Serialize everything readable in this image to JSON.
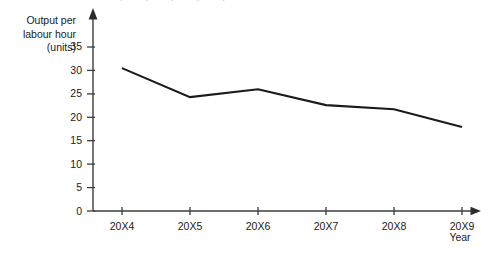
{
  "chart_data": {
    "type": "line",
    "title": "",
    "xlabel": "Year",
    "ylabel": "Output per labour hour (units)",
    "categories": [
      "20X4",
      "20X5",
      "20X6",
      "20X7",
      "20X8",
      "20X9"
    ],
    "values": [
      30.5,
      24.3,
      26.0,
      22.6,
      21.7,
      17.9
    ],
    "series": [
      {
        "name": "Output per labour hour",
        "values": [
          30.5,
          24.3,
          26.0,
          22.6,
          21.7,
          17.9
        ]
      }
    ],
    "ylim": [
      0,
      35
    ],
    "yticks": [
      0,
      5,
      10,
      15,
      20,
      25,
      30,
      35
    ],
    "ytick_labels": [
      "0",
      "5",
      "10",
      "15",
      "20",
      "25",
      "30",
      "35"
    ],
    "grid": false,
    "legend": "none",
    "line_color": "#1a1a1a",
    "axis_color": "#3d3d3d",
    "markers": false
  },
  "axes": {
    "y_caption_lines": [
      "Output per",
      "labour hour",
      "(units)"
    ],
    "x_caption": "Year"
  }
}
